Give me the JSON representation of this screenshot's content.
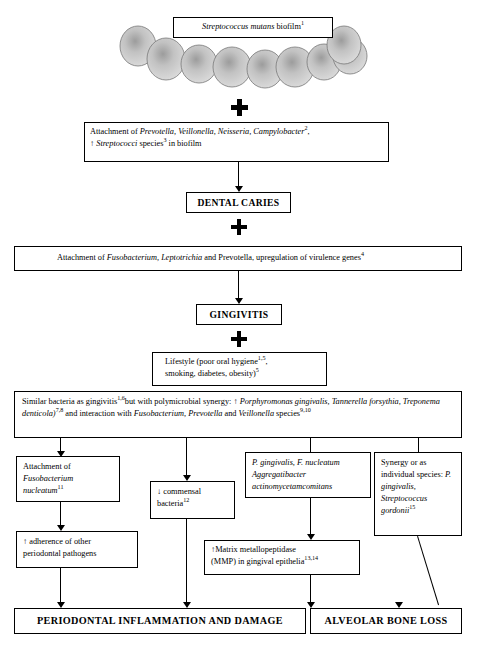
{
  "diagram": {
    "accent_color": "#000000",
    "background_color": "#ffffff",
    "biofilm_cell_color": "#c8c8c8"
  },
  "nodes": {
    "biofilm_label": {
      "name": "streptococcus-mutans-biofilm",
      "text_italic": "Streptococcus mutans",
      "text_plain": " biofilm",
      "superscript": "1"
    },
    "attachment_early": {
      "name": "attachment-early-colonizers",
      "line1_pre": "Attachment of ",
      "line1_italic": "Prevotella, Veillonella, Neisseria, Campylobacter",
      "line1_sup": "2",
      "line1_post": ",",
      "line2_pre": "↑ ",
      "line2_italic": "Streptococci",
      "line2_mid": " species",
      "line2_sup": "3",
      "line2_post": " in biofilm"
    },
    "dental_caries": {
      "name": "dental-caries",
      "label": "DENTAL CARIES"
    },
    "attachment_fuso": {
      "name": "attachment-fusobacterium",
      "pre": "Attachment of ",
      "italic": "Fusobacterium, Leptotrichia",
      "post": " and Prevotella, upregulation of virulence  genes",
      "sup": "4"
    },
    "gingivitis": {
      "name": "gingivitis",
      "label": "GINGIVITIS"
    },
    "lifestyle": {
      "name": "lifestyle-factors",
      "line1": "Lifestyle (poor oral hygiene",
      "line1_sup": "1,5",
      "line1_post": ",",
      "line2": "smoking,  diabetes, obesity)",
      "line2_sup": "5"
    },
    "similar_bacteria": {
      "name": "similar-bacteria-polymicrobial-synergy",
      "seg1": "Similar bacteria as gingivitis",
      "sup1": "1,6",
      "seg2": "but with polymicrobial synergy: ↑ ",
      "italic1": "Porphyromonas gingivalis, Tannerella forsythia, Treponema denticola)",
      "sup2": "7,8",
      "seg3": " and interaction with ",
      "italic2": "Fusobacterium, Prevotella",
      "seg4": " and ",
      "italic3": "Veillonella",
      "seg5": " species",
      "sup3": "9,10"
    },
    "attachment_fn": {
      "name": "attachment-fusobacterium-nucleatum",
      "pre": "Attachment of ",
      "italic": "Fusobacterium nucleatum",
      "sup": "11"
    },
    "commensal": {
      "name": "decreased-commensal-bacteria",
      "line1": "↓ commensal",
      "line2": "bacteria",
      "sup": "12"
    },
    "pg_fn_aa": {
      "name": "pgingivalis-fnucleatum-aggregatibacter",
      "line1": "P. gingivalis, F. nucleatum",
      "line2": "Aggregatibacter",
      "line3": "actinomycetamcomitans"
    },
    "synergy": {
      "name": "synergy-or-individual-species",
      "seg1": "Synergy or as individual species: ",
      "italic1": "P. gingivalis, Streptococcus gordonii",
      "sup": "15"
    },
    "adherence": {
      "name": "increased-adherence-periodontal-pathogens",
      "line1": "↑ adherence of other",
      "line2": "periodontal  pathogens"
    },
    "mmp": {
      "name": "matrix-metallopeptidase",
      "line1": "↑Matrix metallopeptidase",
      "line2": "(MMP) in  gingival  epithelia",
      "sup": "13,14"
    },
    "periodontal_inflammation": {
      "name": "periodontal-inflammation-and-damage",
      "label": "PERIODONTAL INFLAMMATION AND DAMAGE"
    },
    "alveolar_bone_loss": {
      "name": "alveolar-bone-loss",
      "label": "ALVEOLAR BONE LOSS"
    }
  }
}
